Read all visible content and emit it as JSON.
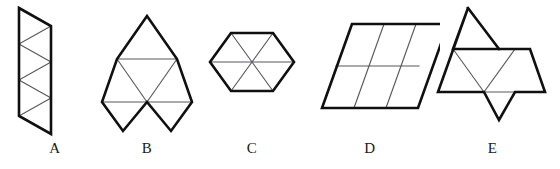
{
  "figure": {
    "background_color": "#ffffff",
    "outline_color": "#101010",
    "interior_line_color": "#59595c",
    "label_color": "#1a1a1a",
    "triangle_count_each": 6,
    "shapes": [
      {
        "label": "A",
        "name": "vertical-zigzag-strip",
        "description": "A narrow vertical strip of four triangles alternating up and down between two vertical sides.",
        "outline_points": "17,10 49,28 49,64 17,82 17,118 49,136 49,100 17,82 17,46 49,28",
        "outline_path": "M17,10 L49,28 L49,136 L17,118 Z",
        "interior_paths": [
          "M17,46 L49,28",
          "M17,46 L49,64",
          "M17,82 L49,64",
          "M17,82 L49,100",
          "M17,118 L49,100"
        ]
      },
      {
        "label": "B",
        "name": "double-diamond-with-apex",
        "description": "A tall figure: one upward triangle on top, a row of two triangles, and two downward triangles hanging below.",
        "outline_path": "M128,10 L158,62 L188,10 L158,62 L188,114 L158,62 L128,114 L158,62 L98,62 Z",
        "outline_path_real": "M128,10 L98,62 L128,114 L158,62 L188,114 L218,62 L188,10 Z",
        "interior_paths": [
          "M113,36 L173,36",
          "M98,62 L218,62",
          "M113,36 L158,62",
          "M173,36 L158,62",
          "M128,10 L158,62"
        ]
      },
      {
        "label": "C",
        "name": "regular-hexagon",
        "description": "A regular hexagon divided into six triangles meeting at the centre.",
        "outline_path": "M240,36 L210,62 L240,88 L280,88 L310,62 L280,36 Z",
        "interior_paths": [
          "M210,62 L310,62",
          "M240,36 L280,88",
          "M280,36 L240,88"
        ]
      },
      {
        "label": "D",
        "name": "rhombus-strip",
        "description": "A leaning parallelogram made of a 3-by-2 arrangement of six triangles.",
        "outline_path": "M355,22 L325,108 L415,108 L445,22 Z",
        "interior_paths": [
          "M340,65 L430,65",
          "M355,22 L325,108",
          "M385,22 L355,108",
          "M415,22 L385,108"
        ]
      },
      {
        "label": "E",
        "name": "arrow-cross",
        "description": "A figure with a triangle pointing up at top left, a horizontal row of triangles, and a triangle pointing down at the bottom centre.",
        "outline_path": "M468,10 L438,62 L498,62 L468,10 Z",
        "outline_path_real": "M468,10 L438,62 L438,88 L498,88 L468,118 L498,88 L528,88 L528,62 Z",
        "interior_paths": [
          "M453,36 L513,36",
          "M438,88 L528,88",
          "M453,36 L483,88",
          "M498,62 L468,118",
          "M468,10 L498,62"
        ]
      }
    ]
  }
}
